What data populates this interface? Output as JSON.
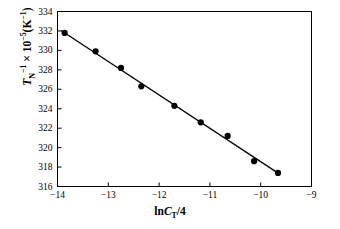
{
  "chart_data": {
    "type": "scatter",
    "title": "",
    "subtitle": "",
    "xlabel": "lnC_T/4",
    "xlabel_parts": {
      "prefix": "lnC",
      "sub": "T",
      "suffix": "/4"
    },
    "ylabel": "T_N^-1 x 10^-5 (K^-1)",
    "ylabel_parts": {
      "symbol": "T",
      "symbol_sub": "N",
      "symbol_sup": "-1",
      "times": "× 10",
      "times_sup": "-5",
      "units_open": "(K",
      "units_sup": "-1",
      "units_close": ")"
    },
    "xlim": [
      -14,
      -9
    ],
    "ylim": [
      316,
      334
    ],
    "xticks": [
      -14,
      -13,
      -12,
      -11,
      -10,
      -9
    ],
    "yticks": [
      316,
      318,
      320,
      322,
      324,
      326,
      328,
      330,
      332,
      334
    ],
    "xtick_labels": [
      "−14",
      "−13",
      "−12",
      "−11",
      "−10",
      "−9"
    ],
    "ytick_labels": [
      "316",
      "318",
      "320",
      "322",
      "324",
      "326",
      "328",
      "330",
      "332",
      "334"
    ],
    "grid": false,
    "legend": false,
    "legend_position": "none",
    "marker": "filled-circle",
    "marker_color": "#000000",
    "line_color": "#000000",
    "axis_color": "#000000",
    "background_color": "#ffffff",
    "series": [
      {
        "name": "TN inverse vs lnCT/4",
        "x": [
          -13.86,
          -13.25,
          -12.75,
          -12.35,
          -11.7,
          -11.18,
          -10.65,
          -10.13,
          -9.66
        ],
        "values": [
          331.8,
          329.9,
          328.2,
          326.3,
          324.3,
          322.6,
          321.2,
          318.6,
          317.4
        ]
      }
    ],
    "fit_line": {
      "name": "linear-fit",
      "x": [
        -13.93,
        -9.62
      ],
      "y": [
        332.05,
        317.25
      ]
    }
  }
}
